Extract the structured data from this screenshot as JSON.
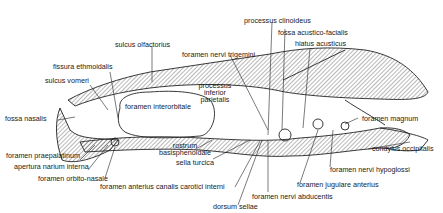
{
  "diagram": {
    "labels": {
      "sulcus_olfactorius": "sulcus olfactorius",
      "foramen_nervi_trigemini": "foramen nervi trigemini",
      "processus_clinoideus": "processus clinoideus",
      "fossa_acustico_facialis": "fossa acustico-facialis",
      "hiatus_acusticus": "hiatus acusticus",
      "fissura_ethmoidalis": "fissura ethmoidalis",
      "sulcus_vomeri": "sulcus vomeri",
      "processus_inferior_parietalis_1": "processus",
      "processus_inferior_parietalis_2": "inferior",
      "processus_inferior_parietalis_3": "parietalis",
      "foramen_interorbitale": "foramen interorbitale",
      "fossa_nasalis": "fossa nasalis",
      "foramen_magnum": "foramen magnum",
      "condylus_occipitalis": "condylus occipitalis",
      "foramen_praepalatinum": "foramen praepalatinum",
      "apertura_narium_interna": "apertura narium interna",
      "foramen_orbito_nasale": "foramen orbito-nasale",
      "rostrum_basisphenoidale_1": "rostrum",
      "rostrum_basisphenoidale_2": "basisphenoidale",
      "sella_turcica": "sella turcica",
      "foramen_anterius_canalis_carotici_interni": "foramen anterius canalis carotici interni",
      "foramen_nervi_hypoglossi": "foramen nervi hypoglossi",
      "foramen_jugulare_anterius": "foramen jugulare anterius",
      "foramen_nervi_abducentis": "foramen nervi abducentis",
      "dorsum_sellae": "dorsum sellae"
    }
  }
}
